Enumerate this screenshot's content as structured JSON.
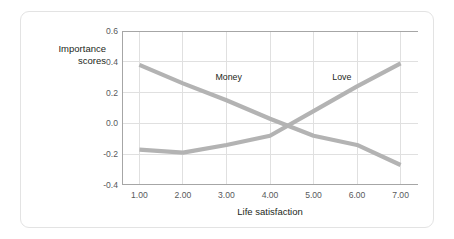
{
  "chart_data": {
    "type": "line",
    "title": "",
    "subtitle": "",
    "xlabel": "Life satisfaction",
    "ylabel": "Importance\nscores",
    "x": [
      1,
      2,
      3,
      4,
      5,
      6,
      7
    ],
    "xtick_labels": [
      "1.00",
      "2.00",
      "3.00",
      "4.00",
      "5.00",
      "6.00",
      "7.00"
    ],
    "ytick_labels": [
      "0.6",
      "0.4",
      "0.2",
      "0.0",
      "-0.2",
      "-0.4"
    ],
    "ytick_values": [
      0.6,
      0.4,
      0.2,
      0.0,
      -0.2,
      -0.4
    ],
    "xlim": [
      0.6,
      7.4
    ],
    "ylim": [
      -0.4,
      0.6
    ],
    "grid": true,
    "legend": "inline-annotations",
    "series": [
      {
        "name": "Money",
        "color": "#b3b3b3",
        "values": [
          0.38,
          0.26,
          0.15,
          0.03,
          -0.08,
          -0.14,
          -0.27
        ],
        "label_x": 3.05,
        "label_y": 0.3
      },
      {
        "name": "Love",
        "color": "#b3b3b3",
        "values": [
          -0.17,
          -0.19,
          -0.14,
          -0.08,
          0.08,
          0.24,
          0.39
        ],
        "label_x": 5.65,
        "label_y": 0.3
      }
    ],
    "annotations": [
      {
        "text": "Money",
        "x": 3.05,
        "y": 0.3
      },
      {
        "text": "Love",
        "x": 5.65,
        "y": 0.3
      }
    ]
  },
  "style": {
    "line_color": "#b3b3b3",
    "grid_color": "#e0e0e0",
    "axis_color": "#a6a6a6",
    "tick_text_color": "#58595b",
    "title_text_color": "#231f20",
    "card_border_color": "#e3e3e3",
    "background": "#ffffff"
  }
}
